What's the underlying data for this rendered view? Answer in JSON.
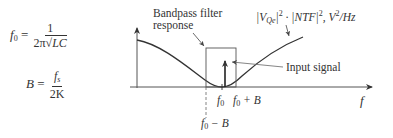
{
  "equations": {
    "f0": {
      "lhs": "f",
      "lhs_sub": "0",
      "equals": "=",
      "numerator": "1",
      "denominator_prefix": "2π",
      "denominator_radicand": "LC"
    },
    "bandwidth": {
      "lhs": "B",
      "equals": "=",
      "numerator": "f",
      "numerator_sub": "s",
      "denominator": "2K"
    }
  },
  "diagram": {
    "curve_label": {
      "part1": "|V",
      "part1_sub": "Qe",
      "part2": "|",
      "part2_sup": "2",
      "part3": " · |NTF|",
      "part3_sup": "2",
      "part4": ", V",
      "part4_sup": "2",
      "part5": "/Hz"
    },
    "filter_label_line1": "Bandpass filter",
    "filter_label_line2": "response",
    "input_signal_label": "Input signal",
    "x_axis_label": "f",
    "tick_f0": "f",
    "tick_f0_sub": "0",
    "tick_f0_plus_B": " + B",
    "tick_f0_minus_B": " − B",
    "colors": {
      "line": "#333333",
      "axis": "#555555",
      "leader": "#666666"
    }
  }
}
